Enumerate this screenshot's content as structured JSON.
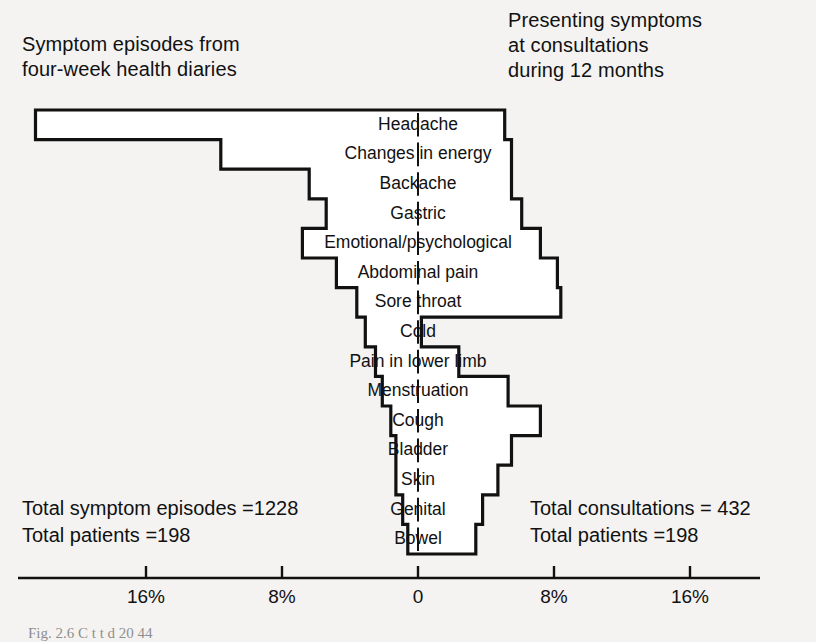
{
  "headers": {
    "left": "Symptom episodes from\nfour-week health diaries",
    "right": "Presenting symptoms\nat consultations\nduring 12 months"
  },
  "totals": {
    "left": "Total symptom episodes =1228\nTotal patients =198",
    "right": "Total consultations = 432\nTotal patients =198"
  },
  "caption": "Fig. 2.6   C                    t                t              d 20  44",
  "axis": {
    "ticks": [
      "16%",
      "8%",
      "0",
      "8%",
      "16%"
    ],
    "zero_label": "0",
    "max_percent": 24
  },
  "colors": {
    "ink": "#111111",
    "paper": "#f4f3f1"
  },
  "chart_data": {
    "type": "bar",
    "xlabel": "%",
    "ylabel": "",
    "orientation": "horizontal-pyramid",
    "xlim": [
      -24,
      24
    ],
    "grid": false,
    "legend": "none",
    "categories": [
      "Headache",
      "Changes in energy",
      "Backache",
      "Gastric",
      "Emotional/psychological",
      "Abdominal pain",
      "Sore throat",
      "Cold",
      "Pain in lower limb",
      "Menstruation",
      "Cough",
      "Bladder",
      "Skin",
      "Genital",
      "Bowel"
    ],
    "series": [
      {
        "name": "Symptom episodes from four-week health diaries",
        "side": "left",
        "values": [
          22.5,
          11.6,
          6.4,
          5.4,
          6.8,
          4.8,
          3.6,
          3.1,
          2.5,
          2.1,
          1.6,
          1.3,
          1.3,
          0.9,
          0.6
        ]
      },
      {
        "name": "Presenting symptoms at consultations during 12 months",
        "side": "right",
        "values": [
          5.1,
          5.5,
          5.5,
          6.1,
          7.2,
          8.2,
          8.4,
          0.2,
          2.4,
          5.3,
          7.2,
          5.5,
          4.7,
          3.8,
          3.4
        ]
      }
    ],
    "annotations": [
      "Total symptom episodes =1228",
      "Total patients =198",
      "Total consultations = 432",
      "Total patients =198"
    ]
  }
}
